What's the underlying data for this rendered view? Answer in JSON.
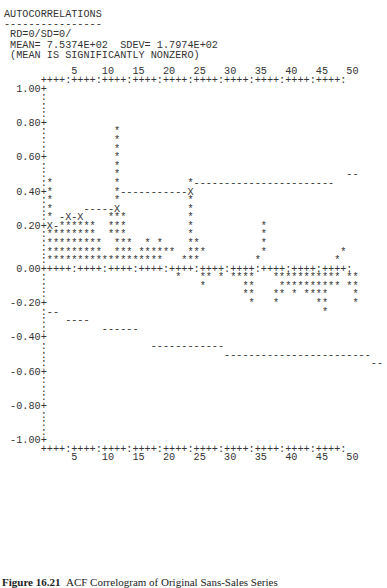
{
  "header": {
    "title": "AUTOCORRELATIONS",
    "underline": "----------------",
    "line1": " RD=0/SD=0/",
    "line2": " MEAN= 7.5374E+02  SDEV= 1.7974E+02",
    "line3": " (MEAN IS SIGNIFICANTLY NONZERO)"
  },
  "plot_lines": [
    "           5    10   15   20   25   30   35   40   45   50",
    "      ++++:++++:++++:++++:++++:++++:++++:++++:++++:++++:",
    "  1.00+",
    "      :",
    "      :",
    "      :",
    "  0.80+",
    "      :           *",
    "      :           *",
    "      :           *",
    "  0.60+           *",
    "      :           *",
    "      :           *                                     --",
    "      :*          *           *-----------------------",
    "  0.40+*          *-----------X",
    "      :*          *           *",
    "      :*     -----X           *",
    "      :* -X-X    ***          *",
    "  0.20+X-******  ***          *           *",
    "      :********  ***          *           *",
    "      :*********  ***  * *    **          *",
    "      :*********  *** ******  ***         *            *",
    "      :*******************   ***         *            *",
    "  0.00+++++:++++:++++:++++:++++:++++:++++:++++:++++:++++:",
    "      :                     *   ** * ****   *********** **",
    "      :                         *      **    ********** **",
    "      :                                **   ** * ****    *",
    " -0.20+                                 *   *      **    *",
    "      :--                                           *",
    "      :   ----",
    "      :         ------",
    " -0.40+",
    "      :                 ------------",
    "      :                             ------------------------",
    "      :                                                     --",
    " -0.60+",
    "      :",
    "      :",
    "      :",
    " -0.80+",
    "      :",
    "      :",
    "      :",
    " -1.00+",
    "      ++++:++++:++++:++++:++++:++++:++++:++++:++++:++++:",
    "           5    10   15   20   25   30   35   40   45   50"
  ],
  "caption": {
    "label": "Figure 16.21",
    "text": "ACF Correlogram of Original Sans-Sales Series"
  },
  "chart_data": {
    "type": "bar",
    "title": "AUTOCORRELATIONS",
    "subtitle": "RD=0/SD=0/ MEAN= 7.5374E+02 SDEV= 1.7974E+02 (MEAN IS SIGNIFICANTLY NONZERO)",
    "xlabel": "Lag",
    "ylabel": "Autocorrelation",
    "x_ticks": [
      5,
      10,
      15,
      20,
      25,
      30,
      35,
      40,
      45,
      50
    ],
    "y_ticks": [
      1.0,
      0.8,
      0.6,
      0.4,
      0.2,
      0.0,
      -0.2,
      -0.4,
      -0.6,
      -0.8,
      -1.0
    ],
    "ylim": [
      -1.0,
      1.0
    ],
    "xlim": [
      1,
      50
    ],
    "grid": false,
    "categories": [
      1,
      2,
      3,
      4,
      5,
      6,
      7,
      8,
      9,
      10,
      11,
      12,
      13,
      14,
      15,
      16,
      17,
      18,
      19,
      20,
      21,
      22,
      23,
      24,
      25,
      26,
      27,
      28,
      29,
      30,
      31,
      32,
      33,
      34,
      35,
      36,
      37,
      38,
      39,
      40,
      41,
      42,
      43,
      44,
      45,
      46,
      47,
      48,
      49,
      50
    ],
    "series": [
      {
        "name": "ACF",
        "values": [
          0.45,
          0.25,
          0.1,
          0.2,
          0.2,
          0.2,
          0.2,
          0.2,
          0.15,
          0.05,
          0.3,
          0.75,
          0.3,
          0.05,
          0.1,
          0.05,
          0.15,
          0.1,
          0.05,
          0.1,
          0.0,
          -0.05,
          0.15,
          0.5,
          0.1,
          -0.1,
          -0.05,
          0.0,
          -0.05,
          0.0,
          -0.05,
          -0.05,
          -0.15,
          -0.2,
          0.0,
          0.25,
          0.0,
          -0.2,
          -0.15,
          -0.1,
          -0.15,
          -0.1,
          -0.15,
          -0.1,
          -0.2,
          -0.25,
          -0.1,
          -0.1,
          0.1,
          -0.2
        ]
      },
      {
        "name": "Upper confidence bound",
        "values": [
          0.25,
          0.3,
          0.3,
          0.3,
          0.3,
          0.3,
          0.35,
          0.35,
          0.35,
          0.35,
          0.35,
          0.35,
          0.45,
          0.45,
          0.45,
          0.45,
          0.45,
          0.45,
          0.45,
          0.45,
          0.45,
          0.45,
          0.45,
          0.45,
          0.5,
          0.5,
          0.5,
          0.5,
          0.5,
          0.5,
          0.5,
          0.5,
          0.5,
          0.5,
          0.5,
          0.5,
          0.5,
          0.5,
          0.5,
          0.5,
          0.5,
          0.5,
          0.5,
          0.5,
          0.5,
          0.5,
          0.5,
          0.55,
          0.55,
          0.55
        ]
      },
      {
        "name": "Lower confidence bound",
        "values": [
          -0.25,
          -0.25,
          -0.3,
          -0.3,
          -0.3,
          -0.3,
          -0.3,
          -0.35,
          -0.35,
          -0.35,
          -0.35,
          -0.35,
          -0.35,
          -0.35,
          -0.35,
          -0.45,
          -0.45,
          -0.45,
          -0.45,
          -0.45,
          -0.45,
          -0.45,
          -0.45,
          -0.45,
          -0.5,
          -0.5,
          -0.5,
          -0.5,
          -0.5,
          -0.5,
          -0.5,
          -0.5,
          -0.5,
          -0.5,
          -0.5,
          -0.5,
          -0.5,
          -0.5,
          -0.5,
          -0.5,
          -0.5,
          -0.5,
          -0.5,
          -0.5,
          -0.5,
          -0.5,
          -0.5,
          -0.5,
          -0.55,
          -0.55
        ]
      }
    ]
  }
}
